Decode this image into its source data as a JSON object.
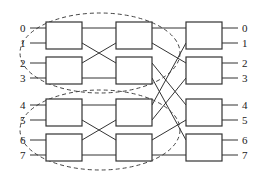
{
  "diagram": {
    "type": "omega-network",
    "input_labels": [
      "0",
      "1",
      "2",
      "3",
      "4",
      "5",
      "6",
      "7"
    ],
    "output_labels": [
      "0",
      "1",
      "2",
      "3",
      "4",
      "5",
      "6",
      "7"
    ],
    "stages": 3,
    "switches_per_stage": 4,
    "colors": {
      "line": "#333333",
      "background": "#ffffff"
    }
  }
}
